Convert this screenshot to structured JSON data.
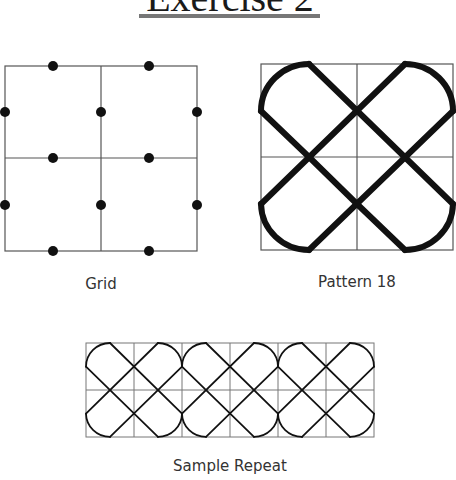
{
  "title": "Exercise 2",
  "figures": [
    {
      "id": "grid",
      "label": "Grid"
    },
    {
      "id": "pattern",
      "label": "Pattern 18"
    },
    {
      "id": "sample",
      "label": "Sample Repeat"
    }
  ],
  "colors": {
    "ink": "#111111",
    "grid_line": "#555555",
    "title_underline": "#777777"
  }
}
